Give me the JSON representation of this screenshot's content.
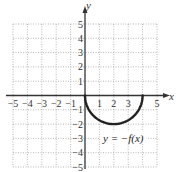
{
  "chart_data": {
    "type": "line",
    "title": "",
    "xlabel": "x",
    "ylabel": "y",
    "xlim": [
      -5,
      5
    ],
    "ylim": [
      -5,
      5
    ],
    "grid": true,
    "x_ticks": [
      "-5",
      "-4",
      "-3",
      "-2",
      "-1",
      "1",
      "2",
      "3",
      "5"
    ],
    "y_ticks": [
      "5",
      "4",
      "3",
      "2",
      "1",
      "-1",
      "-2",
      "-3",
      "-4",
      "-5"
    ],
    "series": [
      {
        "name": "y = -f(x)",
        "shape": "lower semicircle centered at (2,0), radius 2",
        "x": [
          0,
          0.5,
          1,
          2,
          3,
          3.5,
          4
        ],
        "y": [
          0,
          -1.32,
          -1.73,
          -2,
          -1.73,
          -1.32,
          0
        ]
      }
    ],
    "annotations": [
      {
        "text": "y = −f(x)",
        "x": 2.2,
        "y": -3
      }
    ]
  },
  "labels": {
    "x_axis": "x",
    "y_axis": "y",
    "curve_label": "y = −f(x)"
  },
  "colors": {
    "curve": "#222222",
    "axes": "#333333",
    "grid": "#9a9a9a"
  }
}
